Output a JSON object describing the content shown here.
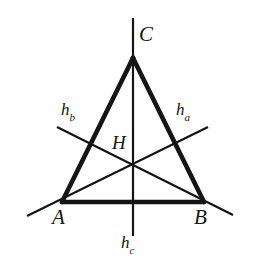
{
  "figure": {
    "kind": "geometry-diagram",
    "background_color": "#ffffff",
    "ink_color": "#141414",
    "canvas": {
      "width": 256,
      "height": 274
    }
  },
  "labels": {
    "vertex_a": "A",
    "vertex_b": "B",
    "vertex_c": "C",
    "orthocenter": "H",
    "altitude_a_base": "h",
    "altitude_a_sub": "a",
    "altitude_b_base": "h",
    "altitude_b_sub": "b",
    "altitude_c_base": "h",
    "altitude_c_sub": "c"
  },
  "geometry": {
    "vertices": {
      "A": {
        "x": 62,
        "y": 202
      },
      "B": {
        "x": 204,
        "y": 202
      },
      "C": {
        "x": 133,
        "y": 58
      }
    },
    "orthocenter": {
      "x": 133,
      "y": 163
    },
    "altitudes": [
      {
        "name": "h_a",
        "from_vertex": "A",
        "foot_on": "BC",
        "extended_start": {
          "x": 27,
          "y": 216
        },
        "extended_end": {
          "x": 208,
          "y": 127
        },
        "stroke_width": 2.2
      },
      {
        "name": "h_b",
        "from_vertex": "B",
        "foot_on": "AC",
        "extended_start": {
          "x": 57,
          "y": 127
        },
        "extended_end": {
          "x": 233,
          "y": 215
        },
        "stroke_width": 2.2
      },
      {
        "name": "h_c",
        "from_vertex": "C",
        "foot_on": "AB",
        "extended_start": {
          "x": 133,
          "y": 18
        },
        "extended_end": {
          "x": 133,
          "y": 236
        },
        "stroke_width": 2.2
      }
    ],
    "triangle_stroke_width": 4.6
  },
  "label_positions": {
    "A": {
      "left": 52,
      "top": 207
    },
    "B": {
      "left": 194,
      "top": 207
    },
    "C": {
      "left": 139,
      "top": 24
    },
    "H": {
      "left": 112,
      "top": 133
    },
    "h_a": {
      "left": 176,
      "top": 101
    },
    "h_b": {
      "left": 61,
      "top": 101
    },
    "h_c": {
      "left": 121,
      "top": 234
    }
  }
}
